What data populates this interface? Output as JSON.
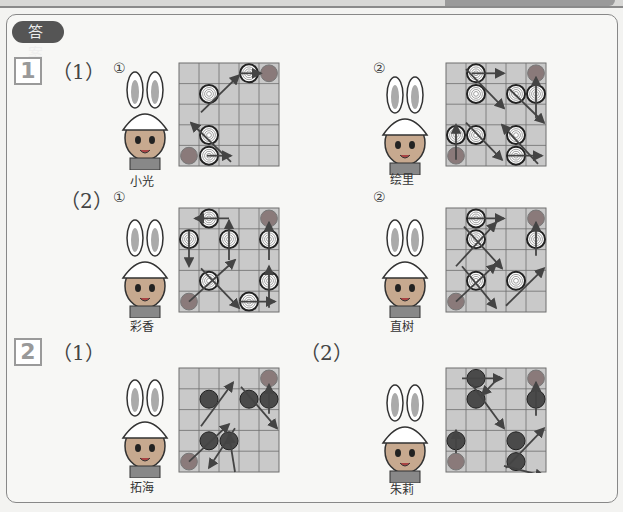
{
  "header": {
    "badge": "答 案"
  },
  "sections": [
    {
      "num": "1",
      "parts": [
        {
          "label": "（1）",
          "items": [
            {
              "circle": "①",
              "name": "小光",
              "grid": {
                "cols": 5,
                "rows": 5,
                "start": [
                  0,
                  4
                ],
                "end": [
                  4,
                  0
                ],
                "style": "target",
                "pieces": [
                  [
                    1,
                    1
                  ],
                  [
                    1,
                    3
                  ],
                  [
                    1,
                    4
                  ],
                  [
                    3,
                    0
                  ]
                ],
                "arrows": [
                  [
                    [
                      0.9,
                      4
                    ],
                    [
                      2.1,
                      4
                    ]
                  ],
                  [
                    [
                      2.1,
                      4.3
                    ],
                    [
                      0.1,
                      2.4
                    ]
                  ],
                  [
                    [
                      0.6,
                      1.9
                    ],
                    [
                      2.5,
                      0.1
                    ]
                  ],
                  [
                    [
                      2.5,
                      0
                    ],
                    [
                      3.6,
                      0
                    ]
                  ]
                ]
              }
            },
            {
              "circle": "②",
              "name": "绘里",
              "grid": {
                "cols": 5,
                "rows": 5,
                "start": [
                  0,
                  4
                ],
                "end": [
                  4,
                  0
                ],
                "style": "target",
                "pieces": [
                  [
                    0,
                    3
                  ],
                  [
                    1,
                    3
                  ],
                  [
                    1,
                    1
                  ],
                  [
                    1,
                    0
                  ],
                  [
                    3,
                    1
                  ],
                  [
                    4,
                    1
                  ],
                  [
                    3,
                    3
                  ],
                  [
                    3,
                    4
                  ]
                ],
                "arrows": [
                  [
                    [
                      0,
                      4.2
                    ],
                    [
                      0,
                      2.5
                    ]
                  ],
                  [
                    [
                      0.5,
                      2.4
                    ],
                    [
                      2.3,
                      4.2
                    ]
                  ],
                  [
                    [
                      2.6,
                      4
                    ],
                    [
                      4.3,
                      4
                    ]
                  ],
                  [
                    [
                      4.1,
                      4.4
                    ],
                    [
                      2.3,
                      2.5
                    ]
                  ],
                  [
                    [
                      0.5,
                      -0.2
                    ],
                    [
                      2.4,
                      1.7
                    ]
                  ],
                  [
                    [
                      0.8,
                      0
                    ],
                    [
                      2.4,
                      0
                    ]
                  ],
                  [
                    [
                      2.6,
                      0.7
                    ],
                    [
                      4.4,
                      2.4
                    ]
                  ],
                  [
                    [
                      4,
                      2.2
                    ],
                    [
                      4,
                      0.2
                    ]
                  ]
                ]
              }
            }
          ]
        },
        {
          "label": "（2）",
          "items": [
            {
              "circle": "①",
              "name": "彩香",
              "grid": {
                "cols": 5,
                "rows": 5,
                "start": [
                  0,
                  4
                ],
                "end": [
                  4,
                  0
                ],
                "style": "target",
                "pieces": [
                  [
                    1,
                    3
                  ],
                  [
                    1,
                    0
                  ],
                  [
                    0,
                    1
                  ],
                  [
                    2,
                    1
                  ],
                  [
                    3,
                    4
                  ],
                  [
                    4,
                    3
                  ],
                  [
                    4,
                    1
                  ]
                ],
                "xcross": [
                  [
                    1,
                    3
                  ]
                ],
                "arrows": [
                  [
                    [
                      0,
                      4
                    ],
                    [
                      2.3,
                      2
                    ]
                  ],
                  [
                    [
                      0.6,
                      2.4
                    ],
                    [
                      2.5,
                      4.3
                    ]
                  ],
                  [
                    [
                      2.5,
                      4
                    ],
                    [
                      4.3,
                      4
                    ]
                  ],
                  [
                    [
                      4,
                      4.3
                    ],
                    [
                      4,
                      2.3
                    ]
                  ],
                  [
                    [
                      4,
                      2
                    ],
                    [
                      4,
                      0.2
                    ]
                  ],
                  [
                    [
                      2,
                      2
                    ],
                    [
                      2,
                      0.1
                    ]
                  ],
                  [
                    [
                      2,
                      0
                    ],
                    [
                      0.3,
                      0
                    ]
                  ],
                  [
                    [
                      0,
                      0.6
                    ],
                    [
                      0,
                      2.3
                    ]
                  ]
                ]
              }
            },
            {
              "circle": "②",
              "name": "直树",
              "grid": {
                "cols": 5,
                "rows": 5,
                "start": [
                  0,
                  4
                ],
                "end": [
                  4,
                  0
                ],
                "style": "target",
                "pieces": [
                  [
                    1,
                    0
                  ],
                  [
                    1,
                    1
                  ],
                  [
                    1,
                    3
                  ],
                  [
                    3,
                    3
                  ],
                  [
                    4,
                    1
                  ]
                ],
                "xcross": [
                  [
                    1,
                    1
                  ],
                  [
                    1,
                    3
                  ]
                ],
                "arrows": [
                  [
                    [
                      0,
                      4
                    ],
                    [
                      2,
                      2.2
                    ]
                  ],
                  [
                    [
                      0.3,
                      2.3
                    ],
                    [
                      2,
                      4.3
                    ]
                  ],
                  [
                    [
                      2.5,
                      4.2
                    ],
                    [
                      4.4,
                      2.4
                    ]
                  ],
                  [
                    [
                      4,
                      1.8
                    ],
                    [
                      4,
                      0.2
                    ]
                  ],
                  [
                    [
                      0,
                      2.3
                    ],
                    [
                      2,
                      0.2
                    ]
                  ],
                  [
                    [
                      0.4,
                      0.4
                    ],
                    [
                      2.3,
                      2.4
                    ]
                  ],
                  [
                    [
                      0.6,
                      0
                    ],
                    [
                      2.4,
                      0
                    ]
                  ]
                ]
              }
            }
          ]
        }
      ]
    },
    {
      "num": "2",
      "parts": [
        {
          "label": "（1）",
          "items": [
            {
              "circle": "",
              "name": "拓海",
              "grid": {
                "cols": 5,
                "rows": 5,
                "start": [
                  0,
                  4
                ],
                "end": [
                  4,
                  0
                ],
                "style": "stone",
                "pieces": [
                  [
                    1,
                    1
                  ],
                  [
                    3,
                    1
                  ],
                  [
                    4,
                    1
                  ],
                  [
                    1,
                    3
                  ],
                  [
                    2,
                    3
                  ]
                ],
                "arrows": [
                  [
                    [
                      0,
                      4
                    ],
                    [
                      2,
                      2.2
                    ]
                  ],
                  [
                    [
                      2.3,
                      2.4
                    ],
                    [
                      1,
                      4.3
                    ]
                  ],
                  [
                    [
                      2.3,
                      4.5
                    ],
                    [
                      2,
                      2.7
                    ]
                  ],
                  [
                    [
                      0.6,
                      2.3
                    ],
                    [
                      2.2,
                      0.2
                    ]
                  ],
                  [
                    [
                      2.6,
                      0.4
                    ],
                    [
                      4.4,
                      2.4
                    ]
                  ],
                  [
                    [
                      4,
                      1.7
                    ],
                    [
                      4,
                      0.3
                    ]
                  ]
                ]
              }
            },
            {
              "circle": "",
              "name": "朱莉",
              "grid": {
                "cols": 5,
                "rows": 5,
                "start": [
                  0,
                  4
                ],
                "end": [
                  4,
                  0
                ],
                "style": "stone",
                "pieces": [
                  [
                    1,
                    0
                  ],
                  [
                    1,
                    1
                  ],
                  [
                    0,
                    3
                  ],
                  [
                    3,
                    3
                  ],
                  [
                    3,
                    4
                  ],
                  [
                    4,
                    1
                  ]
                ],
                "arrows": [
                  [
                    [
                      0,
                      3.6
                    ],
                    [
                      0,
                      2.5
                    ]
                  ],
                  [
                    [
                      0.3,
                      0
                    ],
                    [
                      2.3,
                      0
                    ]
                  ],
                  [
                    [
                      2.2,
                      -0.1
                    ],
                    [
                      1.3,
                      0.8
                    ]
                  ],
                  [
                    [
                      0.8,
                      0.3
                    ],
                    [
                      2.4,
                      2.4
                    ]
                  ],
                  [
                    [
                      2.5,
                      4.3
                    ],
                    [
                      4.4,
                      2.4
                    ]
                  ],
                  [
                    [
                      2.4,
                      4.2
                    ],
                    [
                      4.4,
                      4.7
                    ]
                  ],
                  [
                    [
                      4,
                      1.8
                    ],
                    [
                      4,
                      0.2
                    ]
                  ]
                ]
              }
            }
          ]
        }
      ]
    }
  ],
  "colors": {
    "cell": "#c9c9c9",
    "gridline": "#6f6f6f",
    "piece": "#3a3a3a",
    "marker": "#8a7a7a",
    "arrow": "#444444",
    "stone": "#4a4a4a"
  }
}
